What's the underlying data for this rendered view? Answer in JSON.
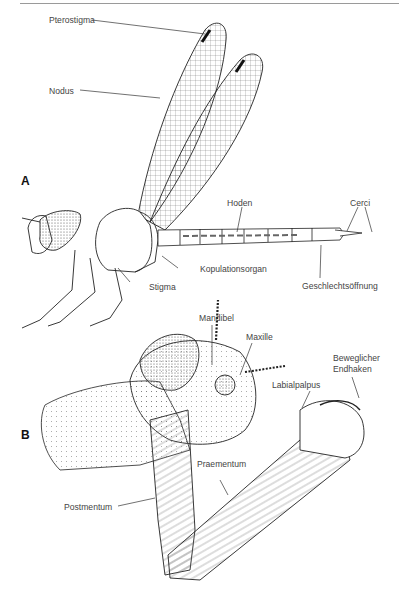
{
  "panels": {
    "a": "A",
    "b": "B"
  },
  "figure_a": {
    "subject": "dragonfly-lateral-view",
    "labels": {
      "pterostigma": "Pterostigma",
      "nodus": "Nodus",
      "hoden": "Hoden",
      "cerci": "Cerci",
      "kopulationsorgan": "Kopulationsorgan",
      "stigma": "Stigma",
      "geschlechtsoeffnung": "Geschlechtsöffnung"
    }
  },
  "figure_b": {
    "subject": "larval-head-labial-mask",
    "labels": {
      "mandibel": "Mandibel",
      "maxille": "Maxille",
      "beweglicher_endhaken_1": "Beweglicher",
      "beweglicher_endhaken_2": "Endhaken",
      "labialpalpus": "Labialpalpus",
      "praementum": "Praementum",
      "postmentum": "Postmentum"
    }
  }
}
